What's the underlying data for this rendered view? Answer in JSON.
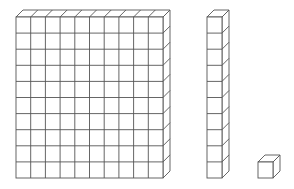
{
  "diagram": {
    "title": "Base-ten blocks",
    "colors": {
      "stroke": "#555555",
      "fill": "#ffffff",
      "background": "#ffffff"
    },
    "blocks": [
      {
        "name": "hundred-flat",
        "label": "100 flat",
        "columns": 10,
        "rows": 10,
        "x": 16,
        "y": 17,
        "cell_w": 14.7,
        "cell_h": 16.1,
        "depth_x": 7,
        "depth_y": 7
      },
      {
        "name": "ten-rod",
        "label": "10 rod",
        "columns": 1,
        "rows": 10,
        "x": 207,
        "y": 17,
        "cell_w": 15,
        "cell_h": 16.1,
        "depth_x": 7,
        "depth_y": 7
      },
      {
        "name": "unit-cube",
        "label": "1 unit",
        "columns": 1,
        "rows": 1,
        "x": 258,
        "y": 162,
        "cell_w": 15,
        "cell_h": 16,
        "depth_x": 7,
        "depth_y": 7
      }
    ]
  }
}
